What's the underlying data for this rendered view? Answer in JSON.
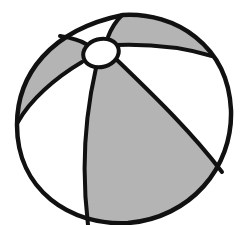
{
  "image": {
    "subject": "beach ball",
    "style": "line illustration",
    "colors": {
      "background": "#ffffff",
      "outline": "#111111",
      "panel_gray": "#b4b4b4",
      "panel_white": "#ffffff"
    },
    "panels": [
      {
        "name": "top-right",
        "fill": "gray"
      },
      {
        "name": "top-left-upper",
        "fill": "white"
      },
      {
        "name": "left",
        "fill": "gray"
      },
      {
        "name": "lower-left",
        "fill": "white"
      },
      {
        "name": "center-front",
        "fill": "gray"
      },
      {
        "name": "right",
        "fill": "white"
      }
    ]
  }
}
